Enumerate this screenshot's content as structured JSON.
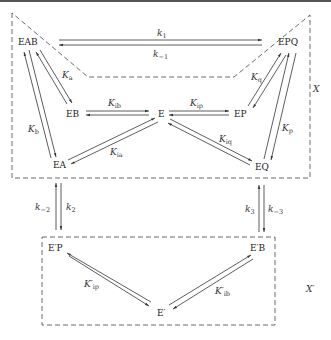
{
  "diagram": {
    "type": "enzyme-kinetic-mechanism",
    "regions": {
      "X": "X",
      "X_prime": "X′"
    },
    "species": {
      "EAB": "EAB",
      "EPQ": "EPQ",
      "EB": "EB",
      "E": "E",
      "EP": "EP",
      "EA": "EA",
      "EQ": "EQ",
      "EpP": "E′P",
      "EpB": "E′B",
      "Ep": "E′"
    },
    "constants": {
      "k1": {
        "base": "k",
        "sub": "1"
      },
      "km1": {
        "base": "k",
        "sub": "−1"
      },
      "Ka": {
        "base": "K",
        "sub": "a"
      },
      "Kb": {
        "base": "K",
        "sub": "b"
      },
      "Kib": {
        "base": "K",
        "sub": "ib"
      },
      "Kip": {
        "base": "K",
        "sub": "ip"
      },
      "Kia": {
        "base": "K",
        "sub": "ia"
      },
      "Kiq": {
        "base": "K",
        "sub": "iq"
      },
      "Kq": {
        "base": "K",
        "sub": "q"
      },
      "Kp": {
        "base": "K",
        "sub": "p"
      },
      "km2": {
        "base": "k",
        "sub": "−2"
      },
      "k2": {
        "base": "k",
        "sub": "2"
      },
      "k3": {
        "base": "k",
        "sub": "3"
      },
      "km3": {
        "base": "k",
        "sub": "−3"
      },
      "Kpip": {
        "base": "K′",
        "sub": "ip"
      },
      "Kpib": {
        "base": "K′",
        "sub": "ib"
      }
    },
    "edges": [
      {
        "from": "EAB",
        "to": "EPQ",
        "forward": "k1",
        "reverse": "km1"
      },
      {
        "from": "EAB",
        "to": "EB",
        "label": "Ka"
      },
      {
        "from": "EAB",
        "to": "EA",
        "label": "Kb"
      },
      {
        "from": "EB",
        "to": "E",
        "label": "Kib"
      },
      {
        "from": "E",
        "to": "EP",
        "label": "Kip"
      },
      {
        "from": "EA",
        "to": "E",
        "label": "Kia"
      },
      {
        "from": "E",
        "to": "EQ",
        "label": "Kiq"
      },
      {
        "from": "EPQ",
        "to": "EP",
        "label": "Kq"
      },
      {
        "from": "EPQ",
        "to": "EQ",
        "label": "Kp"
      },
      {
        "from": "EA",
        "to": "E′P",
        "forward": "k2",
        "reverse": "km2"
      },
      {
        "from": "EQ",
        "to": "E′B",
        "forward": "k3",
        "reverse": "km3"
      },
      {
        "from": "E′P",
        "to": "E′",
        "label": "Kpip"
      },
      {
        "from": "E′",
        "to": "E′B",
        "label": "Kpib"
      }
    ]
  }
}
